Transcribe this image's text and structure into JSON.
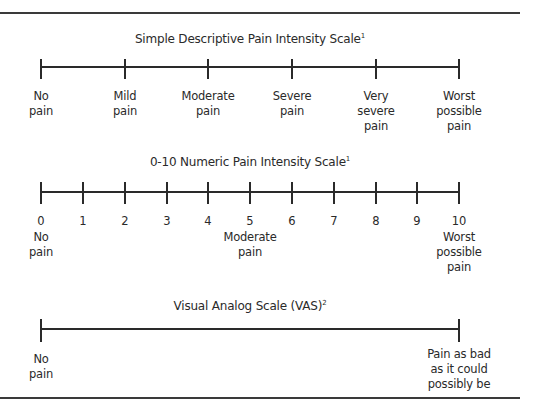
{
  "border": {
    "color": "#3a3a3a"
  },
  "scales": {
    "descriptive": {
      "title": "Simple Descriptive Pain Intensity Scale",
      "title_sup": "1",
      "labels": [
        "No\npain",
        "Mild\npain",
        "Moderate\npain",
        "Severe\npain",
        "Very\nsevere\npain",
        "Worst\npossible\npain"
      ]
    },
    "numeric": {
      "title": "0-10 Numeric Pain Intensity Scale",
      "title_sup": "1",
      "numbers": [
        "0",
        "1",
        "2",
        "3",
        "4",
        "5",
        "6",
        "7",
        "8",
        "9",
        "10"
      ],
      "anchors": {
        "left": "No\npain",
        "middle": "Moderate\npain",
        "right": "Worst\npossible\npain"
      }
    },
    "vas": {
      "title": "Visual Analog Scale (VAS)",
      "title_sup": "2",
      "anchors": {
        "left": "No\npain",
        "right": "Pain as bad\nas it could\npossibly be"
      }
    }
  }
}
